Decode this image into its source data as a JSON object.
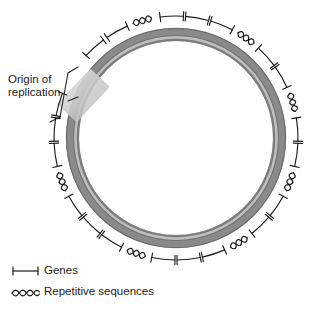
{
  "figure": {
    "title_visible": false,
    "background_color": "#ffffff"
  },
  "annotations": {
    "origin_label": "Origin of\nreplication",
    "origin_label_line1": "Origin of",
    "origin_label_line2": "replication"
  },
  "legend": {
    "items": [
      {
        "symbol": "gene-bracket",
        "label": "Genes"
      },
      {
        "symbol": "squiggle",
        "label": "Repetitive sequences"
      }
    ],
    "genes_label": "Genes",
    "repeats_label": "Repetitive sequences"
  },
  "colors": {
    "ring_dark": "#6e6e6e",
    "ring_mid": "#8d8d8d",
    "ring_light": "#c9c9c9",
    "ring_outline": "#5a5a5a",
    "origin_patch": "#cfcfcf",
    "ink": "#1b1b1b",
    "background": "#ffffff"
  },
  "chart_data": {
    "type": "diagram",
    "geometry": {
      "center_x": 176,
      "center_y": 138,
      "outer_radius": 110,
      "ring_thickness": 13,
      "marker_radius": 122
    },
    "origin_of_replication": {
      "angle_deg": 207,
      "patch_width": 26,
      "patch_height": 46
    },
    "features": [
      {
        "type": "gene",
        "angle_deg": 268,
        "span_deg": 11
      },
      {
        "type": "gene",
        "angle_deg": 280,
        "span_deg": 11
      },
      {
        "type": "gene",
        "angle_deg": 292,
        "span_deg": 11
      },
      {
        "type": "repeat",
        "angle_deg": 305,
        "span_deg": 12
      },
      {
        "type": "gene",
        "angle_deg": 318,
        "span_deg": 11
      },
      {
        "type": "gene",
        "angle_deg": 330,
        "span_deg": 11
      },
      {
        "type": "repeat",
        "angle_deg": 343,
        "span_deg": 12
      },
      {
        "type": "gene",
        "angle_deg": 356,
        "span_deg": 11
      },
      {
        "type": "gene",
        "angle_deg": 8,
        "span_deg": 11
      },
      {
        "type": "repeat",
        "angle_deg": 21,
        "span_deg": 12
      },
      {
        "type": "gene",
        "angle_deg": 34,
        "span_deg": 11
      },
      {
        "type": "gene",
        "angle_deg": 46,
        "span_deg": 11
      },
      {
        "type": "repeat",
        "angle_deg": 59,
        "span_deg": 12
      },
      {
        "type": "gene",
        "angle_deg": 72,
        "span_deg": 11
      },
      {
        "type": "gene",
        "angle_deg": 84,
        "span_deg": 11
      },
      {
        "type": "gene",
        "angle_deg": 96,
        "span_deg": 11
      },
      {
        "type": "repeat",
        "angle_deg": 109,
        "span_deg": 12
      },
      {
        "type": "gene",
        "angle_deg": 122,
        "span_deg": 11
      },
      {
        "type": "gene",
        "angle_deg": 134,
        "span_deg": 11
      },
      {
        "type": "gene",
        "angle_deg": 146,
        "span_deg": 11
      },
      {
        "type": "repeat",
        "angle_deg": 159,
        "span_deg": 12
      },
      {
        "type": "gene",
        "angle_deg": 172,
        "span_deg": 11
      },
      {
        "type": "gene",
        "angle_deg": 184,
        "span_deg": 11
      },
      {
        "type": "gene",
        "angle_deg": 196,
        "span_deg": 11
      },
      {
        "type": "gene",
        "angle_deg": 228,
        "span_deg": 11
      },
      {
        "type": "gene",
        "angle_deg": 241,
        "span_deg": 11
      },
      {
        "type": "repeat",
        "angle_deg": 254,
        "span_deg": 12
      }
    ],
    "counts": {
      "genes": 21,
      "repeats": 6
    }
  }
}
